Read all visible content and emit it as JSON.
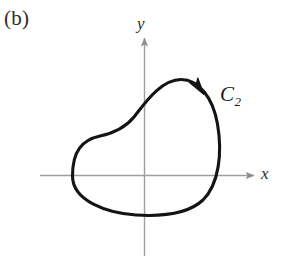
{
  "figure": {
    "panel_label": "(b)",
    "background_color": "#ffffff",
    "curve_color": "#111111",
    "axis_color": "#9a9a9a",
    "axis_labels": {
      "x": "x",
      "y": "y"
    },
    "curve_label": {
      "base": "C",
      "subscript": "2"
    },
    "orientation": "clockwise",
    "arrow_marker": "curve-direction-arrowhead"
  },
  "geometry": {
    "origin": {
      "x": 144,
      "y": 175
    },
    "x_axis": {
      "x_start": 40,
      "x_end": 256,
      "y": 175
    },
    "y_axis": {
      "x": 144,
      "y_start": 36,
      "y_end": 256
    },
    "curve_bounds": {
      "left": 72,
      "right": 219,
      "top": 79,
      "bottom": 216
    },
    "curve_path": "M 72 176 C 72 148 86 138 106 134 C 122 131 132 125 141 112 C 152 96 166 80 182 80 C 200 80 214 98 218 126 C 223 156 218 186 200 202 C 182 218 152 219 128 214 C 100 208 72 200 72 176 Z",
    "arrowhead_tip": {
      "x": 203,
      "y": 93
    },
    "arrowhead_angle_deg": 62
  }
}
